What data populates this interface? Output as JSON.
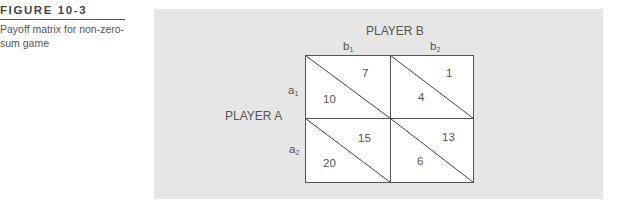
{
  "caption": {
    "label": "FIGURE 10-3",
    "text": "Payoff matrix for non-zero-sum game"
  },
  "matrix": {
    "column_player": "PLAYER B",
    "row_player": "PLAYER A",
    "columns": [
      {
        "base": "b",
        "sub": "1"
      },
      {
        "base": "b",
        "sub": "2"
      }
    ],
    "rows": [
      {
        "base": "a",
        "sub": "1"
      },
      {
        "base": "a",
        "sub": "2"
      }
    ],
    "cells": [
      [
        {
          "b": "7",
          "a": "10"
        },
        {
          "b": "1",
          "a": "4"
        }
      ],
      [
        {
          "b": "15",
          "a": "20"
        },
        {
          "b": "13",
          "a": "6"
        }
      ]
    ]
  },
  "colors": {
    "panel": "#e6e6e6",
    "cell": "#ffffff",
    "line": "#555555"
  }
}
